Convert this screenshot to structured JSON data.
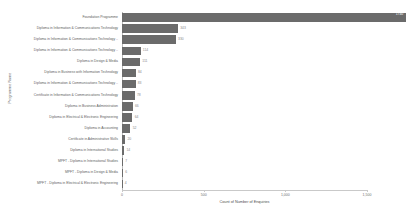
{
  "chart_data": {
    "type": "bar",
    "orientation": "horizontal",
    "title": "",
    "xlabel": "Count of Number of Enquiries",
    "ylabel": "Programme Name",
    "xlim": [
      0,
      1500
    ],
    "xticks": [
      0,
      500,
      1000,
      1500
    ],
    "xticklabels": [
      "0",
      "500",
      "1,000",
      "1,500"
    ],
    "grid": false,
    "legend": null,
    "bar_color": "#6b6b6b",
    "categories": [
      "Foundation Programme",
      "Diploma in Information & Communications Technology",
      "Diploma in Information & Communications Technology ..",
      "Diploma in Information & Communications Technology ..",
      "Diploma in Design & Media",
      "Diploma in Business with Information Technology",
      "Diploma in Information & Communications Technology ..",
      "Certificate in Information & Communications Technology",
      "Diploma in Business Administration",
      "Diploma in Electrical & Electronic Engineering",
      "Diploma in Accounting",
      "Certificate in Administrative Skills",
      "Diploma in International Studies",
      "MPFT - Diploma in International Studies",
      "MPFT - Diploma in Design & Media",
      "MPFT - Diploma in Electrical & Electronic Engineering"
    ],
    "values": [
      1740,
      343,
      330,
      114,
      111,
      84,
      83,
      78,
      66,
      64,
      52,
      20,
      14,
      7,
      6,
      4
    ],
    "value_labels": [
      "1740",
      "343",
      "330",
      "114",
      "111",
      "84",
      "83",
      "78",
      "66",
      "64",
      "52",
      "20",
      "14",
      "7",
      "6",
      "4"
    ],
    "label_inside_first_bar": true
  }
}
